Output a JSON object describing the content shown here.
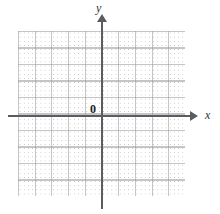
{
  "figure": {
    "kind": "cartesian-coordinate-grid"
  },
  "labels": {
    "y_axis": "y",
    "x_axis": "x",
    "origin": "0"
  },
  "colors": {
    "background": "#ffffff",
    "axis": "#5b5b60",
    "grid_major": "#96969b",
    "grid_dot": "#a5a5aa",
    "label": "#333338",
    "origin_label": "#1e1e22"
  },
  "chart_data": {
    "type": "scatter",
    "title": "",
    "xlabel": "x",
    "ylabel": "y",
    "series": [],
    "x": [],
    "values": [],
    "xlim": [
      -5,
      5
    ],
    "ylim": [
      -5,
      5
    ],
    "grid": true,
    "legend": "none"
  }
}
